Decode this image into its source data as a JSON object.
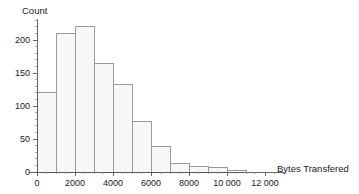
{
  "chart_data": {
    "type": "bar",
    "title": "",
    "subtitle": "",
    "xlabel": "Bytes Transfered",
    "ylabel": "Count",
    "bin_width": 1000,
    "bin_edges": [
      0,
      1000,
      2000,
      3000,
      4000,
      5000,
      6000,
      7000,
      8000,
      9000,
      10000,
      11000
    ],
    "categories": [
      "0–1000",
      "1000–2000",
      "2000–3000",
      "3000–4000",
      "4000–5000",
      "5000–6000",
      "6000–7000",
      "7000–8000",
      "8000–9000",
      "9000–10000",
      "10000–11000"
    ],
    "values": [
      121,
      210,
      220,
      164,
      132,
      77,
      39,
      13,
      8,
      7,
      3
    ],
    "xlim": [
      -400,
      13000
    ],
    "ylim": [
      0,
      232
    ],
    "xticks": [
      0,
      2000,
      4000,
      6000,
      8000,
      10000,
      12000
    ],
    "xticklabels": [
      "0",
      "2000",
      "4000",
      "6000",
      "8000",
      "10 000",
      "12 000"
    ],
    "xminor_step": 500,
    "yticks": [
      0,
      50,
      100,
      150,
      200
    ],
    "yticklabels": [
      "0",
      "50",
      "100",
      "150",
      "200"
    ],
    "yminor_step": 10,
    "grid": false,
    "legend": null,
    "bar_fill_color": "#f7f7f7",
    "bar_edge_color": "#8a8a8a",
    "axis_color": "#555555",
    "text_color": "#1a1a1a"
  }
}
